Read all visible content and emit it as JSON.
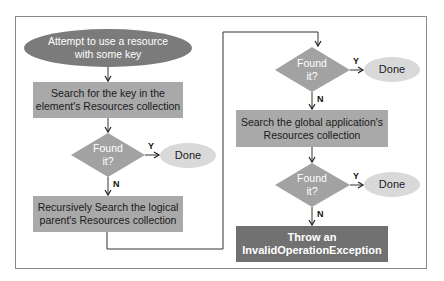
{
  "diagram": {
    "type": "flowchart",
    "title": "",
    "colors": {
      "start_fill": "#7b7b7b",
      "process_fill": "#a9a9a9",
      "decision_fill": "#a2a2a2",
      "done_fill": "#d9d9d9",
      "throw_fill": "#717171",
      "line": "#333333",
      "frame": "#8a8a8a"
    },
    "nodes": {
      "start": {
        "label": "Attempt to use a resource with some key",
        "line1": "Attempt to use a resource",
        "line2": "with some key"
      },
      "search_element": {
        "line1": "Search for the key in the",
        "line2": "element's Resources collection"
      },
      "decision1": {
        "line1": "Found",
        "line2": "it?"
      },
      "done1": {
        "label": "Done"
      },
      "search_parent": {
        "line1": "Recursively Search the logical",
        "line2": "parent's Resources collection"
      },
      "decision2": {
        "line1": "Found",
        "line2": "it?"
      },
      "done2": {
        "label": "Done"
      },
      "search_global": {
        "line1": "Search the global application's",
        "line2": "Resources collection"
      },
      "decision3": {
        "line1": "Found",
        "line2": "it?"
      },
      "done3": {
        "label": "Done"
      },
      "throw": {
        "line1": "Throw an",
        "line2": "InvalidOperationException"
      }
    },
    "edges": [
      {
        "from": "start",
        "to": "search_element",
        "label": ""
      },
      {
        "from": "search_element",
        "to": "decision1",
        "label": ""
      },
      {
        "from": "decision1",
        "to": "done1",
        "label": "Y"
      },
      {
        "from": "decision1",
        "to": "search_parent",
        "label": "N"
      },
      {
        "from": "search_parent",
        "to": "decision2",
        "label": ""
      },
      {
        "from": "decision2",
        "to": "done2",
        "label": "Y"
      },
      {
        "from": "decision2",
        "to": "search_global",
        "label": "N"
      },
      {
        "from": "search_global",
        "to": "decision3",
        "label": ""
      },
      {
        "from": "decision3",
        "to": "done3",
        "label": "Y"
      },
      {
        "from": "decision3",
        "to": "throw",
        "label": "N"
      }
    ],
    "edge_labels": {
      "yes": "Y",
      "no": "N"
    }
  }
}
